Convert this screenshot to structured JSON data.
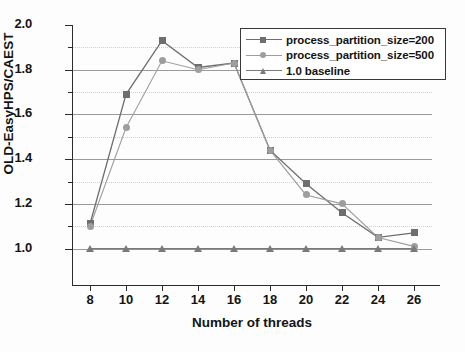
{
  "chart_data": {
    "type": "line",
    "title": "",
    "xlabel": "Number of threads",
    "ylabel": "OLD-EasyHPS/CAEST",
    "x": [
      8,
      10,
      12,
      14,
      16,
      18,
      20,
      22,
      24,
      26
    ],
    "xtick_labels": [
      "8",
      "10",
      "12",
      "14",
      "16",
      "18",
      "20",
      "22",
      "24",
      "26"
    ],
    "ytick_labels": [
      "1.0",
      "1.2",
      "1.4",
      "1.6",
      "1.8",
      "2.0"
    ],
    "ytick_values": [
      1.0,
      1.2,
      1.4,
      1.6,
      1.8,
      2.0
    ],
    "yminor_values": [
      1.1,
      1.3,
      1.5,
      1.7,
      1.9
    ],
    "xlim": [
      7,
      27
    ],
    "ylim": [
      0.94,
      2.0
    ],
    "grid": true,
    "legend_position": "top-right",
    "series": [
      {
        "name": "process_partition_size=200",
        "marker": "square",
        "color": "#6e6e6e",
        "values": [
          1.11,
          1.69,
          1.93,
          1.81,
          1.83,
          1.44,
          1.29,
          1.16,
          1.05,
          1.07
        ]
      },
      {
        "name": "process_partition_size=500",
        "marker": "circle",
        "color": "#9e9e9e",
        "values": [
          1.1,
          1.54,
          1.84,
          1.8,
          1.83,
          1.44,
          1.24,
          1.2,
          1.05,
          1.01
        ]
      },
      {
        "name": "1.0 baseline",
        "marker": "triangle",
        "color": "#7a7a7a",
        "values": [
          1.0,
          1.0,
          1.0,
          1.0,
          1.0,
          1.0,
          1.0,
          1.0,
          1.0,
          1.0
        ]
      }
    ]
  },
  "legend": {
    "items": [
      {
        "label": "process_partition_size=200"
      },
      {
        "label": "process_partition_size=500"
      },
      {
        "label": "1.0 baseline"
      }
    ]
  },
  "axes": {
    "y_title": "OLD-EasyHPS/CAEST",
    "x_title": "Number of threads"
  }
}
